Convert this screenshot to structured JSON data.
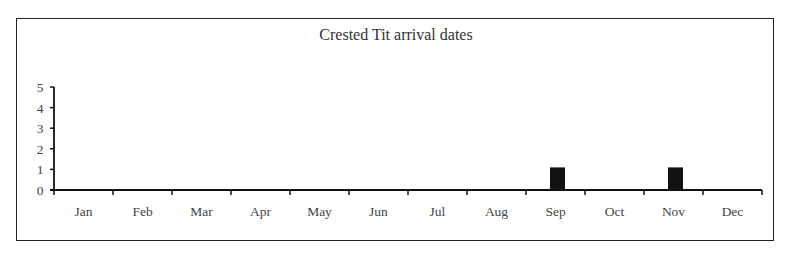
{
  "chart_data": {
    "type": "bar",
    "title": "Crested Tit arrival dates",
    "xlabel": "",
    "ylabel": "",
    "categories": [
      "Jan",
      "Feb",
      "Mar",
      "Apr",
      "May",
      "Jun",
      "Jul",
      "Aug",
      "Sep",
      "Oct",
      "Nov",
      "Dec"
    ],
    "values": [
      0,
      0,
      0,
      0,
      0,
      0,
      0,
      0,
      1,
      0,
      1,
      0
    ],
    "ylim": [
      0,
      5
    ],
    "yticks": [
      0,
      1,
      2,
      3,
      4,
      5
    ],
    "grid": false,
    "legend": null,
    "bar_color": "#111111"
  }
}
